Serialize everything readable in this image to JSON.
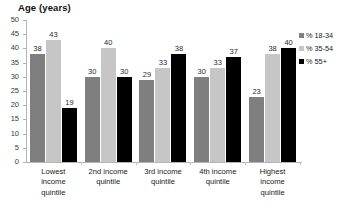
{
  "chart_data": {
    "type": "bar",
    "title": "Age (years)",
    "xlabel": "",
    "ylabel": "",
    "ylim": [
      0,
      50
    ],
    "ytick_step": 5,
    "yticks": [
      50,
      45,
      40,
      35,
      30,
      25,
      20,
      15,
      10,
      5,
      0
    ],
    "grid": false,
    "legend_position": "right",
    "categories": [
      "Lowest\nincome\nquintile",
      "2nd income\nquintile",
      "3rd income\nquintile",
      "4th income\nquintile",
      "Highest\nincome\nquintile"
    ],
    "series": [
      {
        "name": "% 18-34",
        "color": "#7f7f7f",
        "values": [
          38,
          30,
          29,
          30,
          23
        ]
      },
      {
        "name": "% 35-54",
        "color": "#c6c6c6",
        "values": [
          43,
          40,
          33,
          33,
          38
        ]
      },
      {
        "name": "% 55+",
        "color": "#000000",
        "values": [
          19,
          30,
          38,
          37,
          40
        ]
      }
    ]
  },
  "legend": {
    "items": [
      {
        "label": "% 18-34",
        "color": "#7f7f7f"
      },
      {
        "label": "% 35-54",
        "color": "#c6c6c6"
      },
      {
        "label": "% 55+",
        "color": "#000000"
      }
    ]
  },
  "axis": {
    "line_color": "#b5b5b5",
    "tick_color": "#b5b5b5"
  }
}
